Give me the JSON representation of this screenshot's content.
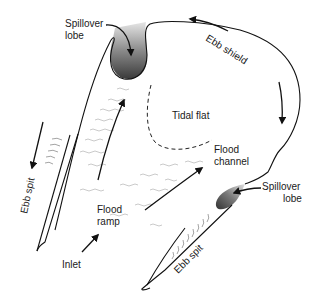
{
  "diagram": {
    "labels": {
      "spillover_lobe_top": [
        "Spillover",
        "lobe"
      ],
      "ebb_shield": "Ebb shield",
      "tidal_flat": "Tidal flat",
      "flood_channel": [
        "Flood",
        "channel"
      ],
      "spillover_lobe_right": [
        "Spillover",
        "lobe"
      ],
      "ebb_spit_left": "Ebb spit",
      "ebb_spit_right": "Ebb spit",
      "flood_ramp": [
        "Flood",
        "ramp"
      ],
      "inlet": "Inlet"
    },
    "colors": {
      "line": "#111111",
      "lobe_dark": "#3a3a3a",
      "lobe_light": "#d8d8d8",
      "wave": "#bdbdbd"
    }
  }
}
